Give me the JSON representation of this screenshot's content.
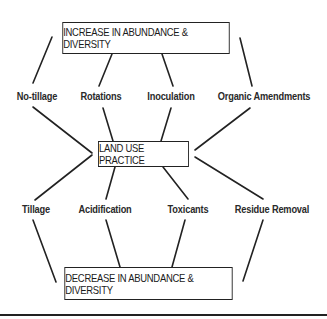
{
  "diagram": {
    "top_box": "INCREASE IN ABUNDANCE & DIVERSITY",
    "center_box": "LAND USE PRACTICE",
    "bottom_box": "DECREASE IN ABUNDANCE & DIVERSITY",
    "increase_factors": [
      "No-tillage",
      "Rotations",
      "Inoculation",
      "Organic Amendments"
    ],
    "decrease_factors": [
      "Tillage",
      "Acidification",
      "Toxicants",
      "Residue Removal"
    ],
    "line_color": "#222222"
  }
}
